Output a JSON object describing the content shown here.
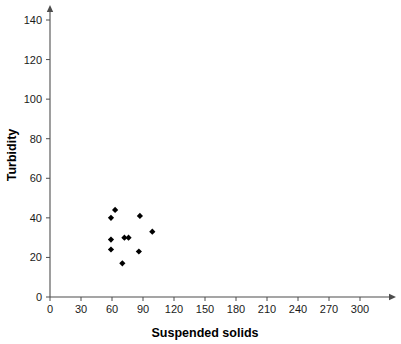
{
  "chart_data": {
    "type": "scatter",
    "title": "",
    "xlabel": "Suspended solids",
    "ylabel": "Turbidity",
    "xlim": [
      0,
      330
    ],
    "ylim": [
      0,
      148
    ],
    "grid": false,
    "legend": null,
    "xticks": [
      0,
      30,
      60,
      90,
      120,
      150,
      180,
      210,
      240,
      270,
      300
    ],
    "yticks": [
      0,
      20,
      40,
      60,
      80,
      100,
      120,
      140
    ],
    "xtick_labels": [
      "0",
      "30",
      "60",
      "90",
      "120",
      "150",
      "180",
      "210",
      "240",
      "270",
      "300"
    ],
    "ytick_labels": [
      "0",
      "20",
      "40",
      "60",
      "80",
      "100",
      "120",
      "140"
    ],
    "marker": "diamond",
    "marker_color": "#000000",
    "points": [
      {
        "x": 63,
        "y": 44
      },
      {
        "x": 59,
        "y": 40
      },
      {
        "x": 87,
        "y": 41
      },
      {
        "x": 59,
        "y": 29
      },
      {
        "x": 72,
        "y": 30
      },
      {
        "x": 76,
        "y": 30
      },
      {
        "x": 99,
        "y": 33
      },
      {
        "x": 59,
        "y": 24
      },
      {
        "x": 86,
        "y": 23
      },
      {
        "x": 70,
        "y": 17
      }
    ]
  },
  "axes": {
    "x_title": "Suspended solids",
    "y_title": "Turbidity"
  }
}
